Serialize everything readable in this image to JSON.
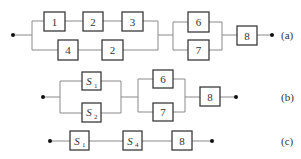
{
  "diagrams": {
    "a": {
      "tag": "(a)",
      "blocks": [
        "1",
        "2",
        "3",
        "4",
        "2",
        "6",
        "7",
        "8"
      ]
    },
    "b": {
      "tag": "(b)",
      "blocks": [
        {
          "base": "S",
          "sub": "1"
        },
        {
          "base": "S",
          "sub": "2"
        },
        "6",
        "7",
        "8"
      ]
    },
    "c": {
      "tag": "(c)",
      "blocks": [
        {
          "base": "S",
          "sub": "1"
        },
        {
          "base": "S",
          "sub": "4"
        },
        "8"
      ]
    }
  },
  "colors": {
    "wire": "#8a8a8a",
    "box_border": "#3a3a3a",
    "dot": "#111111",
    "text": "#333333"
  }
}
